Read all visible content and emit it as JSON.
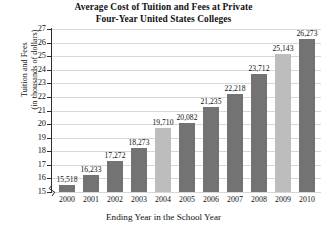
{
  "chart_data": {
    "type": "bar",
    "title": "Average Cost of Tuition and Fees at Private Four-Year United States Colleges",
    "title_lines": [
      "Average Cost of Tuition and Fees at Private",
      "Four-Year United States Colleges"
    ],
    "xlabel": "Ending Year in the School Year",
    "ylabel": "Tuition and Fees (in thousands of dollars)",
    "ylabel_lines": [
      "Tuition and Fees",
      "(in thousands of dollars)"
    ],
    "categories": [
      "2000",
      "2001",
      "2002",
      "2003",
      "2004",
      "2005",
      "2006",
      "2007",
      "2008",
      "2009",
      "2010"
    ],
    "values": [
      15518,
      16233,
      17272,
      18273,
      19710,
      20082,
      21235,
      22218,
      23712,
      25143,
      26273
    ],
    "value_labels": [
      "15,518",
      "16,233",
      "17,272",
      "18,273",
      "19,710",
      "20,082",
      "21,235",
      "22,218",
      "23,712",
      "25,143",
      "26,273"
    ],
    "ylim": [
      15,
      27
    ],
    "ytick_labels": [
      "15",
      "16",
      "17",
      "18",
      "19",
      "20",
      "21",
      "22",
      "23",
      "24",
      "25",
      "26",
      "27"
    ],
    "ytick_values": [
      15,
      16,
      17,
      18,
      19,
      20,
      21,
      22,
      23,
      24,
      25,
      26,
      27
    ],
    "y_units": "thousands of dollars",
    "axis_break": true,
    "grid": true,
    "legend": "none",
    "bar_shades": [
      "dark",
      "dark",
      "dark",
      "dark",
      "light",
      "dark",
      "dark",
      "dark",
      "dark",
      "light",
      "dark"
    ],
    "colors": {
      "bar_dark": "#737373",
      "bar_light": "#bdbdbd",
      "axis": "#2b2b2b",
      "grid": "#d8d8d8",
      "text": "#111111",
      "background": "#ffffff"
    }
  }
}
